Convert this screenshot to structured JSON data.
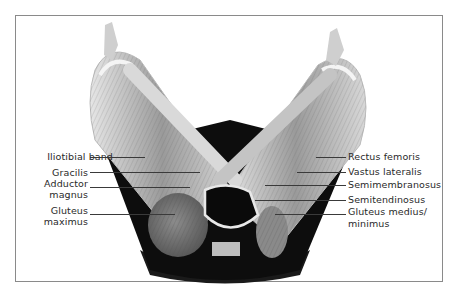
{
  "figure": {
    "frame_color": "#8a8a8a",
    "text_color": "#2a2a2a"
  },
  "labels": {
    "left": [
      {
        "text": "Iliotibial band"
      },
      {
        "text": "Gracilis"
      },
      {
        "text": "Adductor",
        "text2": "magnus"
      },
      {
        "text": "Gluteus",
        "text2": "maximus"
      }
    ],
    "right": [
      {
        "text": "Rectus femoris"
      },
      {
        "text": "Vastus lateralis"
      },
      {
        "text": "Semimembranosus"
      },
      {
        "text": "Semitendinosus"
      },
      {
        "text": "Gluteus medius/",
        "text2": "minimus"
      }
    ]
  }
}
